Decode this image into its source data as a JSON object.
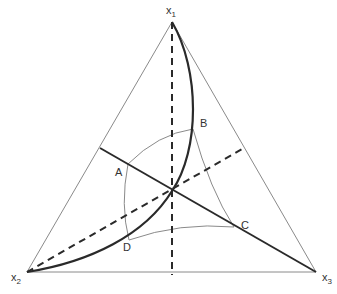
{
  "diagram": {
    "type": "ternary-triangle",
    "vertices": [
      {
        "id": "x1",
        "label": "x",
        "subscript": "1",
        "x": 172,
        "y": 22
      },
      {
        "id": "x2",
        "label": "x",
        "subscript": "2",
        "x": 27,
        "y": 272
      },
      {
        "id": "x3",
        "label": "x",
        "subscript": "3",
        "x": 316,
        "y": 272
      }
    ],
    "center": {
      "x": 172,
      "y": 191
    },
    "points": [
      {
        "id": "A",
        "label": "A",
        "x": 128,
        "y": 164
      },
      {
        "id": "B",
        "label": "B",
        "x": 193,
        "y": 129
      },
      {
        "id": "C",
        "label": "C",
        "x": 234,
        "y": 227
      },
      {
        "id": "D",
        "label": "D",
        "x": 129,
        "y": 240
      }
    ],
    "colors": {
      "thin_line": "#888888",
      "thick_line": "#2a2a2a",
      "text": "#333333",
      "background": "#ffffff"
    }
  }
}
